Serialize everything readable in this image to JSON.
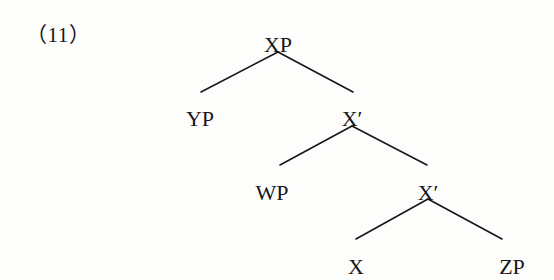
{
  "figure": {
    "example_number": "（11）",
    "caption_label": "(11)",
    "background_color": "#fdfdfc",
    "ink_color": "#16171b"
  },
  "chart_data": {
    "type": "diagram",
    "diagram_kind": "x-bar-syntax-tree",
    "title": "(11)",
    "nodes": [
      {
        "id": "XP",
        "label": "XP",
        "x": 278,
        "y": 34,
        "role": "root-phrase"
      },
      {
        "id": "YP",
        "label": "YP",
        "x": 200,
        "y": 108,
        "role": "specifier"
      },
      {
        "id": "X1a",
        "label": "X′",
        "x": 352,
        "y": 108,
        "role": "intermediate-bar"
      },
      {
        "id": "WP",
        "label": "WP",
        "x": 272,
        "y": 182,
        "role": "adjunct"
      },
      {
        "id": "X1b",
        "label": "X′",
        "x": 428,
        "y": 182,
        "role": "intermediate-bar"
      },
      {
        "id": "X",
        "label": "X",
        "x": 356,
        "y": 256,
        "role": "head"
      },
      {
        "id": "ZP",
        "label": "ZP",
        "x": 512,
        "y": 256,
        "role": "complement"
      }
    ],
    "edges": [
      {
        "from": "XP",
        "to": "YP",
        "x1": 278,
        "y1": 52,
        "x2": 201,
        "y2": 92
      },
      {
        "from": "XP",
        "to": "X1a",
        "x1": 278,
        "y1": 52,
        "x2": 353,
        "y2": 92
      },
      {
        "from": "X1a",
        "to": "WP",
        "x1": 352,
        "y1": 126,
        "x2": 280,
        "y2": 165
      },
      {
        "from": "X1a",
        "to": "X1b",
        "x1": 352,
        "y1": 126,
        "x2": 427,
        "y2": 165
      },
      {
        "from": "X1b",
        "to": "X",
        "x1": 428,
        "y1": 199,
        "x2": 356,
        "y2": 239
      },
      {
        "from": "X1b",
        "to": "ZP",
        "x1": 428,
        "y1": 199,
        "x2": 502,
        "y2": 239
      }
    ],
    "xlabel": "",
    "ylabel": "",
    "legend": []
  }
}
